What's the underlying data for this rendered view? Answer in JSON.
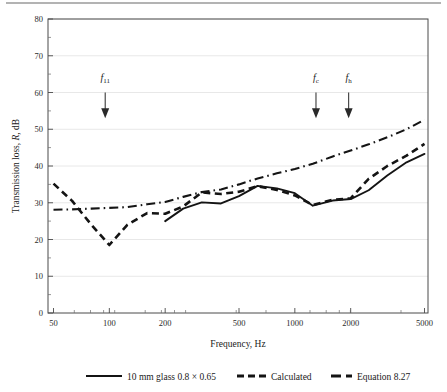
{
  "figure": {
    "name": "transmission-loss-chart",
    "background": "#ffffff",
    "top_rule_color": "#9a9a9a"
  },
  "chart_data": {
    "type": "line",
    "title": "",
    "xlabel": "Frequency, Hz",
    "ylabel": "Transmission loss, R, dB",
    "xscale": "log",
    "xlim": [
      45,
      5600
    ],
    "ylim": [
      0,
      80
    ],
    "grid": true,
    "legend_position": "below-axes",
    "xticks": [
      50,
      100,
      200,
      500,
      1000,
      2000,
      5000
    ],
    "xtick_labels": [
      "50",
      "100",
      "200",
      "500",
      "1000",
      "2000",
      "5000"
    ],
    "yticks": [
      0,
      10,
      20,
      30,
      40,
      50,
      60,
      70,
      80
    ],
    "ytick_labels": [
      "0",
      "10",
      "20",
      "30",
      "40",
      "50",
      "60",
      "70",
      "80"
    ],
    "series": [
      {
        "name": "10 mm glass 0.8 × 0.65",
        "style": "solid",
        "color": "#141414",
        "x": [
          200,
          250,
          315,
          400,
          500,
          630,
          800,
          1000,
          1250,
          1600,
          2000,
          2500,
          3150,
          4000,
          5000
        ],
        "values": [
          25.0,
          28.4,
          30.1,
          29.8,
          31.8,
          34.6,
          33.9,
          32.6,
          29.2,
          30.6,
          31.0,
          33.4,
          37.4,
          41.0,
          43.3
        ]
      },
      {
        "name": "Calculated",
        "style": "dashed",
        "color": "#141414",
        "x": [
          50,
          63,
          80,
          100,
          125,
          160,
          200,
          250,
          315,
          400,
          500,
          630,
          800,
          1000,
          1250,
          1600,
          2000,
          2500,
          3150,
          4000,
          5000
        ],
        "values": [
          35.2,
          30.5,
          24.0,
          18.5,
          24.0,
          27.2,
          27.0,
          29.0,
          32.8,
          32.4,
          33.0,
          34.5,
          33.5,
          32.0,
          29.4,
          30.8,
          31.2,
          36.5,
          40.0,
          42.8,
          46.0
        ]
      },
      {
        "name": "Equation 8.27",
        "style": "dash-dot",
        "color": "#141414",
        "x": [
          50,
          63,
          80,
          100,
          125,
          160,
          200,
          250,
          315,
          400,
          500,
          630,
          800,
          1000,
          1250,
          1600,
          2000,
          2500,
          3150,
          4000,
          5000
        ],
        "values": [
          28.1,
          28.2,
          28.4,
          28.6,
          28.8,
          29.6,
          30.2,
          31.6,
          32.9,
          33.6,
          35.0,
          36.6,
          38.0,
          39.2,
          40.6,
          42.6,
          44.2,
          45.9,
          47.8,
          50.0,
          52.6
        ]
      }
    ],
    "annotations": [
      {
        "id": "f11",
        "symbol": "f",
        "subscript": "11",
        "x_freq": 95,
        "label_y": 63,
        "arrow_from_y": 60,
        "arrow_to_y": 53
      },
      {
        "id": "fc",
        "symbol": "f",
        "subscript": "c",
        "x_freq": 1300,
        "label_y": 63,
        "arrow_from_y": 60,
        "arrow_to_y": 53
      },
      {
        "id": "fh",
        "symbol": "f",
        "subscript": "h",
        "x_freq": 1950,
        "label_y": 63,
        "arrow_from_y": 60,
        "arrow_to_y": 53
      }
    ]
  },
  "legend": {
    "items": [
      {
        "label": "10 mm glass 0.8 × 0.65",
        "style": "solid"
      },
      {
        "label": "Calculated",
        "style": "dashed"
      },
      {
        "label": "Equation 8.27",
        "style": "dash-dot"
      }
    ]
  },
  "axis_titles": {
    "x": "Frequency, Hz",
    "y_prefix": "Transmission loss, ",
    "y_italic": "R",
    "y_suffix": ", dB"
  }
}
